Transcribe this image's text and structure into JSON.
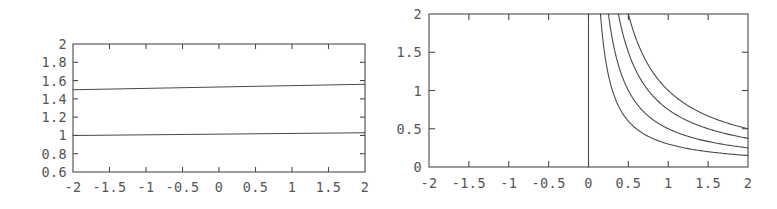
{
  "figure": {
    "background_color": "#ffffff",
    "line_color": "#4a4a4a",
    "text_color": "#555555",
    "panel_count": 2
  },
  "chart_data": [
    {
      "type": "line",
      "panel": "left",
      "title": "",
      "xlabel": "",
      "ylabel": "",
      "xlim": [
        -2,
        2
      ],
      "ylim": [
        0.6,
        2
      ],
      "grid": false,
      "legend": "none",
      "xticks": [
        -2,
        -1.5,
        -1,
        -0.5,
        0,
        0.5,
        1,
        1.5,
        2
      ],
      "xticklabels": [
        "-2",
        "-1.5",
        "-1",
        "-0.5",
        "0",
        "0.5",
        "1",
        "1.5",
        "2"
      ],
      "yticks": [
        0.6,
        0.8,
        1,
        1.2,
        1.4,
        1.6,
        1.8,
        2
      ],
      "yticklabels": [
        "0.6",
        "0.8",
        "1",
        "1.2",
        "1.4",
        "1.6",
        "1.8",
        "2"
      ],
      "series": [
        {
          "name": "upper-line",
          "x": [
            -2,
            2
          ],
          "values": [
            1.5,
            1.56
          ]
        },
        {
          "name": "lower-line",
          "x": [
            -2,
            2
          ],
          "values": [
            1.0,
            1.03
          ]
        }
      ]
    },
    {
      "type": "line",
      "panel": "right",
      "title": "",
      "xlabel": "",
      "ylabel": "",
      "xlim": [
        -2,
        2
      ],
      "ylim": [
        0,
        2
      ],
      "grid": false,
      "legend": "none",
      "xticks": [
        -2,
        -1.5,
        -1,
        -0.5,
        0,
        0.5,
        1,
        1.5,
        2
      ],
      "xticklabels": [
        "-2",
        "-1.5",
        "-1",
        "-0.5",
        "0",
        "0.5",
        "1",
        "1.5",
        "2"
      ],
      "yticks": [
        0,
        0.5,
        1,
        1.5,
        2
      ],
      "yticklabels": [
        "0",
        "0.5",
        "1",
        "1.5",
        "2"
      ],
      "series": [
        {
          "name": "vertical-asymptote",
          "x": [
            0,
            0
          ],
          "values": [
            0,
            2
          ]
        },
        {
          "name": "hyperbola-c-1.00",
          "constant": 1.0,
          "x": [
            0.5,
            0.75,
            1,
            1.25,
            1.5,
            1.75,
            2
          ],
          "values": [
            2.0,
            1.33,
            1.0,
            0.8,
            0.67,
            0.57,
            0.5
          ]
        },
        {
          "name": "hyperbola-c-0.75",
          "constant": 0.75,
          "x": [
            0.375,
            0.5,
            0.75,
            1,
            1.25,
            1.5,
            1.75,
            2
          ],
          "values": [
            2.0,
            1.5,
            1.0,
            0.75,
            0.6,
            0.5,
            0.43,
            0.375
          ]
        },
        {
          "name": "hyperbola-c-0.50",
          "constant": 0.5,
          "x": [
            0.25,
            0.5,
            0.75,
            1,
            1.25,
            1.5,
            1.75,
            2
          ],
          "values": [
            2.0,
            1.0,
            0.67,
            0.5,
            0.4,
            0.33,
            0.29,
            0.25
          ]
        },
        {
          "name": "hyperbola-c-0.30",
          "constant": 0.3,
          "x": [
            0.15,
            0.25,
            0.5,
            0.75,
            1,
            1.25,
            1.5,
            1.75,
            2
          ],
          "values": [
            2.0,
            1.2,
            0.6,
            0.4,
            0.3,
            0.24,
            0.2,
            0.17,
            0.15
          ]
        }
      ]
    }
  ]
}
